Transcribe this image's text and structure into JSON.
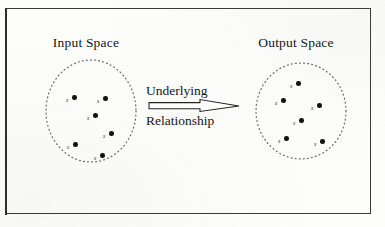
{
  "figure": {
    "caption_absent": true,
    "background_color": "#fdfdfc",
    "frame_color": "#3b3b3b",
    "ink_color": "#111111"
  },
  "input_space": {
    "title": "Input Space",
    "ellipse": {
      "cx": 90,
      "cy": 111,
      "rx": 43,
      "ry": 50,
      "stroke_style": "dotted"
    },
    "points": [
      {
        "label": "x",
        "x": 72,
        "y": 95
      },
      {
        "label": "x",
        "x": 103,
        "y": 96
      },
      {
        "label": "x",
        "x": 93,
        "y": 113
      },
      {
        "label": "x",
        "x": 109,
        "y": 131
      },
      {
        "label": "x",
        "x": 73,
        "y": 142
      },
      {
        "label": "x",
        "x": 100,
        "y": 153
      }
    ]
  },
  "output_space": {
    "title": "Output Space",
    "ellipse": {
      "cx": 301,
      "cy": 111,
      "rx": 45,
      "ry": 48,
      "stroke_style": "dotted"
    },
    "points": [
      {
        "label": "x",
        "x": 296,
        "y": 81
      },
      {
        "label": "x",
        "x": 281,
        "y": 98
      },
      {
        "label": "x",
        "x": 317,
        "y": 103
      },
      {
        "label": "x",
        "x": 299,
        "y": 118
      },
      {
        "label": "x",
        "x": 284,
        "y": 136
      },
      {
        "label": "x",
        "x": 320,
        "y": 139
      }
    ]
  },
  "relation": {
    "word_top": "Underlying",
    "word_bottom": "Relationship",
    "arrow": {
      "name": "right-arrow-outline",
      "direction": "right",
      "style": "hollow-outline",
      "stroke_color": "#222222"
    }
  }
}
